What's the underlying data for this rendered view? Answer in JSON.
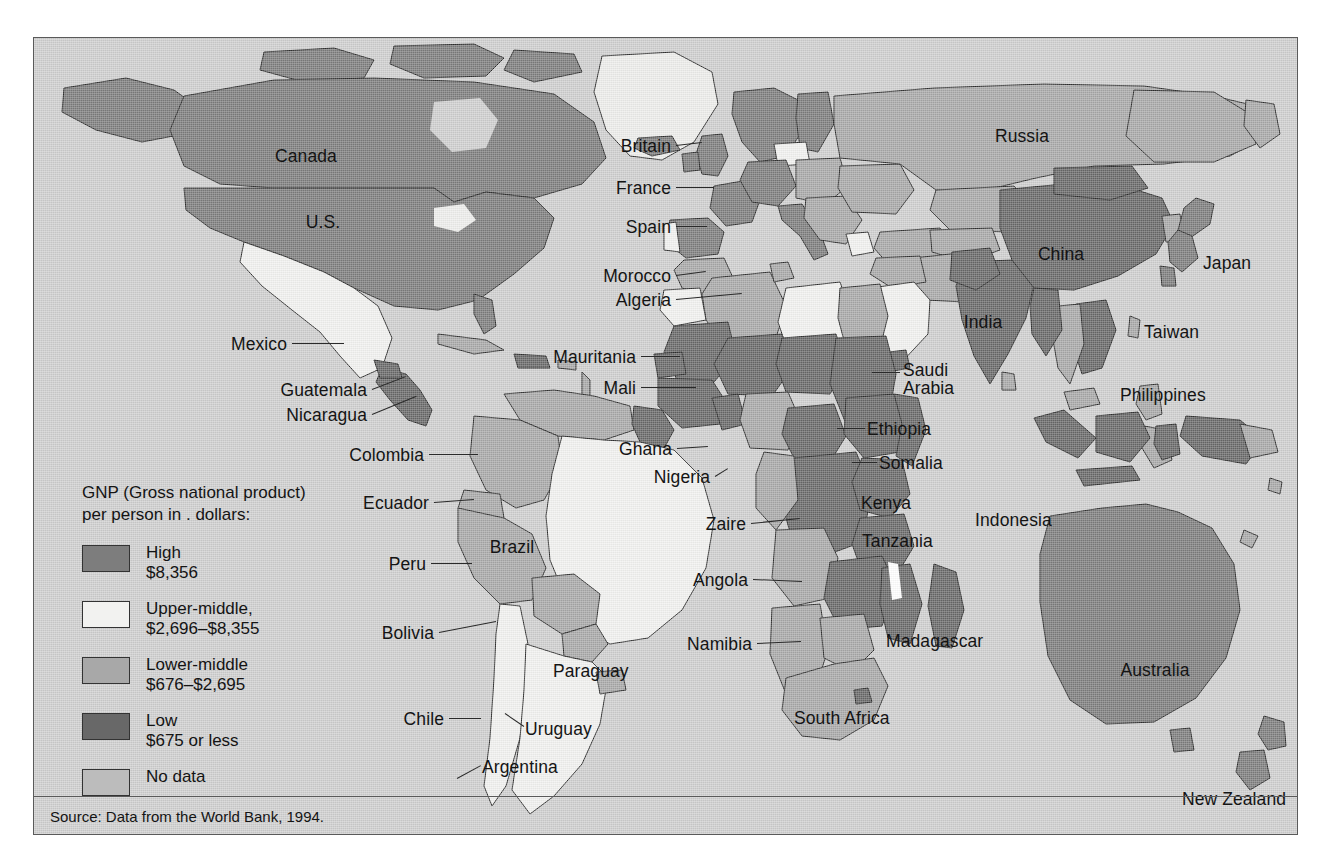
{
  "figure": {
    "type": "choropleth-world-map",
    "source_note": "Source: Data from the World Bank, 1994."
  },
  "legend": {
    "title": "GNP (Gross national product)\nper person in  . dollars:",
    "items": [
      {
        "id": "high",
        "label": "High",
        "range": "$8,356",
        "color": "#7d7d7d"
      },
      {
        "id": "upper-middle",
        "label": "Upper-middle,",
        "range": "$2,696–$8,355",
        "color": "#f2f2f0"
      },
      {
        "id": "lower-middle",
        "label": "Lower-middle",
        "range": "$676–$2,695",
        "color": "#a8a8a8"
      },
      {
        "id": "low",
        "label": "Low",
        "range": "$675 or less",
        "color": "#686868"
      },
      {
        "id": "no-data",
        "label": "No data",
        "range": "",
        "color": "#bcbcbc"
      }
    ]
  },
  "colors": {
    "background": "#cfcfcf",
    "frame": "#5a5a5a",
    "text": "#141414",
    "high": "#7d7d7d",
    "upper_middle": "#f2f2f0",
    "lower_middle": "#a8a8a8",
    "low": "#686868",
    "no_data": "#bcbcbc"
  },
  "map_labels": [
    {
      "name": "Canada",
      "text": "Canada",
      "x": 272,
      "y": 109,
      "align": "c",
      "leader": null
    },
    {
      "name": "US",
      "text": "U.S.",
      "x": 289,
      "y": 175,
      "align": "c",
      "leader": null
    },
    {
      "name": "Mexico",
      "text": "Mexico",
      "x": 253,
      "y": 297,
      "align": "r",
      "leader": {
        "x1": 258,
        "y1": 305,
        "x2": 310,
        "y2": 305
      }
    },
    {
      "name": "Guatemala",
      "text": "Guatemala",
      "x": 333,
      "y": 343,
      "align": "r",
      "leader": {
        "x1": 338,
        "y1": 351,
        "x2": 372,
        "y2": 338
      }
    },
    {
      "name": "Nicaragua",
      "text": "Nicaragua",
      "x": 333,
      "y": 368,
      "align": "r",
      "leader": {
        "x1": 338,
        "y1": 376,
        "x2": 382,
        "y2": 358
      }
    },
    {
      "name": "Colombia",
      "text": "Colombia",
      "x": 390,
      "y": 408,
      "align": "r",
      "leader": {
        "x1": 395,
        "y1": 416,
        "x2": 444,
        "y2": 416
      }
    },
    {
      "name": "Ecuador",
      "text": "Ecuador",
      "x": 395,
      "y": 456,
      "align": "r",
      "leader": {
        "x1": 400,
        "y1": 464,
        "x2": 440,
        "y2": 461
      }
    },
    {
      "name": "Peru",
      "text": "Peru",
      "x": 392,
      "y": 517,
      "align": "r",
      "leader": {
        "x1": 397,
        "y1": 525,
        "x2": 438,
        "y2": 525
      }
    },
    {
      "name": "Brazil",
      "text": "Brazil",
      "x": 478,
      "y": 500,
      "align": "c",
      "leader": null
    },
    {
      "name": "Bolivia",
      "text": "Bolivia",
      "x": 400,
      "y": 586,
      "align": "r",
      "leader": {
        "x1": 405,
        "y1": 594,
        "x2": 462,
        "y2": 583
      }
    },
    {
      "name": "Paraguay",
      "text": "Paraguay",
      "x": 519,
      "y": 624,
      "align": "l",
      "leader": null
    },
    {
      "name": "Chile",
      "text": "Chile",
      "x": 410,
      "y": 672,
      "align": "r",
      "leader": {
        "x1": 415,
        "y1": 680,
        "x2": 447,
        "y2": 680
      }
    },
    {
      "name": "Uruguay",
      "text": "Uruguay",
      "x": 491,
      "y": 682,
      "align": "l",
      "leader": {
        "x1": 471,
        "y1": 675,
        "x2": 490,
        "y2": 688
      }
    },
    {
      "name": "Argentina",
      "text": "Argentina",
      "x": 448,
      "y": 720,
      "align": "l",
      "leader": {
        "x1": 423,
        "y1": 740,
        "x2": 447,
        "y2": 727
      }
    },
    {
      "name": "Britain",
      "text": "Britain",
      "x": 637,
      "y": 99,
      "align": "r",
      "leader": {
        "x1": 642,
        "y1": 107,
        "x2": 668,
        "y2": 104
      }
    },
    {
      "name": "France",
      "text": "France",
      "x": 637,
      "y": 141,
      "align": "r",
      "leader": {
        "x1": 642,
        "y1": 149,
        "x2": 680,
        "y2": 149
      }
    },
    {
      "name": "Spain",
      "text": "Spain",
      "x": 637,
      "y": 180,
      "align": "r",
      "leader": {
        "x1": 642,
        "y1": 188,
        "x2": 673,
        "y2": 188
      }
    },
    {
      "name": "Morocco",
      "text": "Morocco",
      "x": 637,
      "y": 229,
      "align": "r",
      "leader": {
        "x1": 642,
        "y1": 237,
        "x2": 672,
        "y2": 233
      }
    },
    {
      "name": "Algeria",
      "text": "Algeria",
      "x": 637,
      "y": 253,
      "align": "r",
      "leader": {
        "x1": 642,
        "y1": 261,
        "x2": 708,
        "y2": 255
      }
    },
    {
      "name": "Mauritania",
      "text": "Mauritania",
      "x": 602,
      "y": 310,
      "align": "r",
      "leader": {
        "x1": 607,
        "y1": 318,
        "x2": 646,
        "y2": 318
      }
    },
    {
      "name": "Mali",
      "text": "Mali",
      "x": 602,
      "y": 341,
      "align": "r",
      "leader": {
        "x1": 607,
        "y1": 349,
        "x2": 662,
        "y2": 349
      }
    },
    {
      "name": "Ghana",
      "text": "Ghana",
      "x": 638,
      "y": 402,
      "align": "r",
      "leader": {
        "x1": 643,
        "y1": 410,
        "x2": 674,
        "y2": 408
      }
    },
    {
      "name": "Nigeria",
      "text": "Nigeria",
      "x": 676,
      "y": 430,
      "align": "r",
      "leader": {
        "x1": 681,
        "y1": 438,
        "x2": 694,
        "y2": 430
      }
    },
    {
      "name": "Saudi Arabia",
      "text": "Saudi\nArabia",
      "x": 869,
      "y": 323,
      "align": "l",
      "leader": {
        "x1": 838,
        "y1": 334,
        "x2": 866,
        "y2": 334
      }
    },
    {
      "name": "Ethiopia",
      "text": "Ethiopia",
      "x": 833,
      "y": 382,
      "align": "l",
      "leader": {
        "x1": 803,
        "y1": 390,
        "x2": 831,
        "y2": 390
      }
    },
    {
      "name": "Somalia",
      "text": "Somalia",
      "x": 845,
      "y": 416,
      "align": "l",
      "leader": {
        "x1": 818,
        "y1": 424,
        "x2": 843,
        "y2": 424
      }
    },
    {
      "name": "Kenya",
      "text": "Kenya",
      "x": 827,
      "y": 456,
      "align": "l",
      "leader": null
    },
    {
      "name": "Zaire",
      "text": "Zaire",
      "x": 712,
      "y": 477,
      "align": "r",
      "leader": {
        "x1": 717,
        "y1": 485,
        "x2": 766,
        "y2": 480
      }
    },
    {
      "name": "Tanzania",
      "text": "Tanzania",
      "x": 828,
      "y": 494,
      "align": "l",
      "leader": null
    },
    {
      "name": "Angola",
      "text": "Angola",
      "x": 714,
      "y": 533,
      "align": "r",
      "leader": {
        "x1": 719,
        "y1": 541,
        "x2": 768,
        "y2": 543
      }
    },
    {
      "name": "Namibia",
      "text": "Namibia",
      "x": 718,
      "y": 597,
      "align": "r",
      "leader": {
        "x1": 723,
        "y1": 605,
        "x2": 767,
        "y2": 603
      }
    },
    {
      "name": "Madagascar",
      "text": "Madagascar",
      "x": 852,
      "y": 594,
      "align": "l",
      "leader": null
    },
    {
      "name": "South Africa",
      "text": "South Africa",
      "x": 760,
      "y": 671,
      "align": "l",
      "leader": null
    },
    {
      "name": "Russia",
      "text": "Russia",
      "x": 988,
      "y": 89,
      "align": "c",
      "leader": null
    },
    {
      "name": "China",
      "text": "China",
      "x": 1027,
      "y": 207,
      "align": "c",
      "leader": null
    },
    {
      "name": "Japan",
      "text": "Japan",
      "x": 1169,
      "y": 216,
      "align": "l",
      "leader": null
    },
    {
      "name": "India",
      "text": "India",
      "x": 949,
      "y": 275,
      "align": "c",
      "leader": null
    },
    {
      "name": "Taiwan",
      "text": "Taiwan",
      "x": 1110,
      "y": 285,
      "align": "l",
      "leader": null
    },
    {
      "name": "Philippines",
      "text": "Philippines",
      "x": 1086,
      "y": 348,
      "align": "l",
      "leader": null
    },
    {
      "name": "Indonesia",
      "text": "Indonesia",
      "x": 941,
      "y": 473,
      "align": "l",
      "leader": null
    },
    {
      "name": "Australia",
      "text": "Australia",
      "x": 1121,
      "y": 623,
      "align": "c",
      "leader": null
    },
    {
      "name": "New Zealand",
      "text": "New Zealand",
      "x": 1200,
      "y": 752,
      "align": "c",
      "leader": null
    }
  ]
}
